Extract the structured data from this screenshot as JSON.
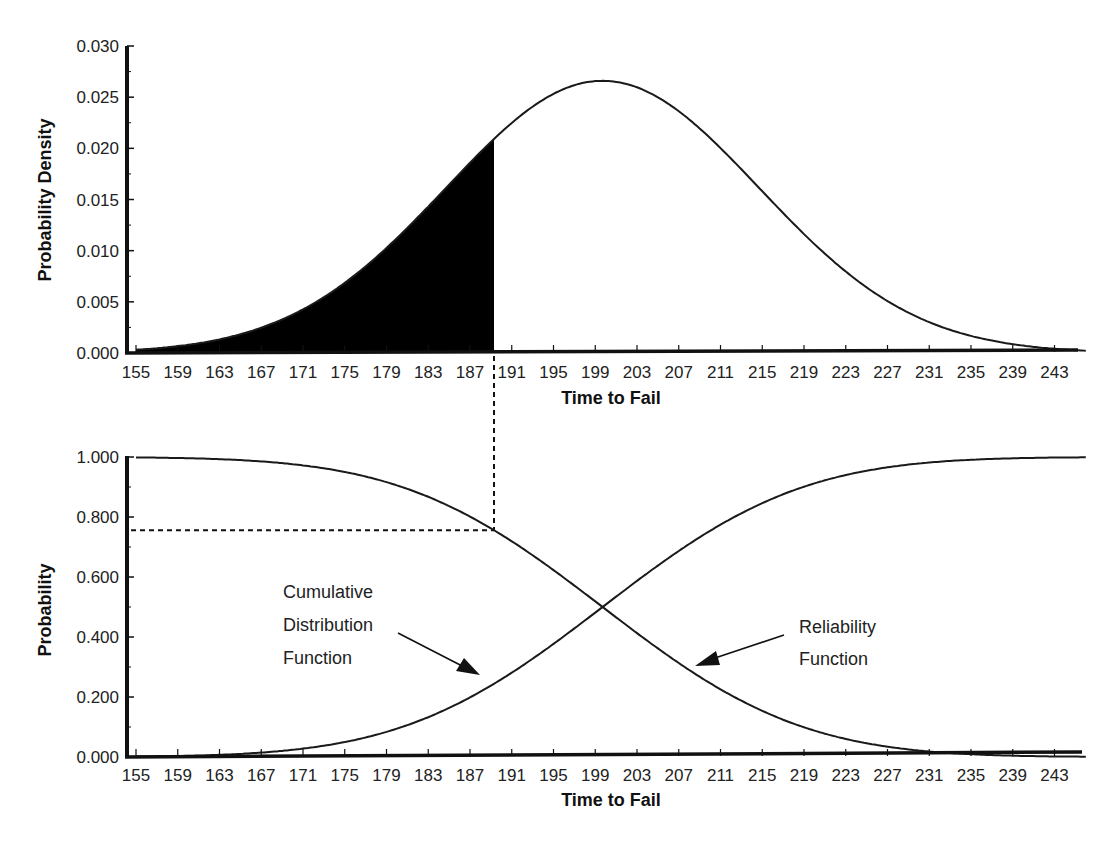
{
  "chart_data": [
    {
      "id": "pdf",
      "type": "area",
      "title": "",
      "xlabel": "Time to Fail",
      "ylabel": "Probability Density",
      "x_tick_labels": [
        "155",
        "159",
        "163",
        "167",
        "171",
        "175",
        "179",
        "183",
        "187",
        "191",
        "195",
        "199",
        "203",
        "207",
        "211",
        "215",
        "219",
        "223",
        "227",
        "231",
        "235",
        "239",
        "243"
      ],
      "y_tick_labels": [
        "0.000",
        "0.005",
        "0.010",
        "0.015",
        "0.020",
        "0.025",
        "0.030"
      ],
      "xlim": [
        154,
        246
      ],
      "ylim": [
        0,
        0.03
      ],
      "grid": false,
      "legend": null,
      "distribution": {
        "name": "normal",
        "mean": 199.7,
        "std": 15
      },
      "series": [
        {
          "name": "Probability density function",
          "style": "line",
          "x": [
            155,
            159,
            163,
            167,
            171,
            175,
            179,
            183,
            187,
            189.3,
            191,
            195,
            199,
            203,
            207,
            211,
            215,
            219,
            223,
            227,
            231,
            235,
            239,
            243,
            246
          ],
          "values": [
            0.0016,
            0.0027,
            0.0044,
            0.0066,
            0.0095,
            0.0131,
            0.0172,
            0.0214,
            0.0248,
            0.0208,
            0.0229,
            0.0253,
            0.0266,
            0.0261,
            0.0237,
            0.0201,
            0.0158,
            0.0115,
            0.0078,
            0.0049,
            0.0029,
            0.0016,
            0.0008,
            0.0004,
            0.0002
          ]
        },
        {
          "name": "Shaded area (failure probability up to t)",
          "style": "filled",
          "x_from": 155,
          "x_to": 189.3
        }
      ],
      "annotations": [
        {
          "type": "dashed-vertical-line",
          "x": 189.3,
          "extends_to": "lower chart"
        }
      ]
    },
    {
      "id": "cdf-reliability",
      "type": "line",
      "title": "",
      "xlabel": "Time to Fail",
      "ylabel": "Probability",
      "x_tick_labels": [
        "155",
        "159",
        "163",
        "167",
        "171",
        "175",
        "179",
        "183",
        "187",
        "191",
        "195",
        "199",
        "203",
        "207",
        "211",
        "215",
        "219",
        "223",
        "227",
        "231",
        "235",
        "239",
        "243"
      ],
      "y_tick_labels": [
        "0.000",
        "0.200",
        "0.400",
        "0.600",
        "0.800",
        "1.000"
      ],
      "xlim": [
        154,
        246
      ],
      "ylim": [
        0,
        1.0
      ],
      "grid": false,
      "legend": null,
      "distribution": {
        "name": "normal",
        "mean": 199.7,
        "std": 15
      },
      "series": [
        {
          "name": "Cumulative Distribution Function",
          "x": [
            155,
            159,
            163,
            167,
            171,
            175,
            179,
            183,
            187,
            191,
            195,
            199,
            203,
            207,
            211,
            215,
            219,
            223,
            227,
            231,
            235,
            239,
            243
          ],
          "values": [
            0.001,
            0.003,
            0.007,
            0.015,
            0.028,
            0.05,
            0.084,
            0.133,
            0.198,
            0.281,
            0.378,
            0.481,
            0.587,
            0.686,
            0.773,
            0.846,
            0.901,
            0.94,
            0.966,
            0.982,
            0.991,
            0.996,
            0.998
          ]
        },
        {
          "name": "Reliability Function",
          "x": [
            155,
            159,
            163,
            167,
            171,
            175,
            179,
            183,
            187,
            191,
            195,
            199,
            203,
            207,
            211,
            215,
            219,
            223,
            227,
            231,
            235,
            239,
            243
          ],
          "values": [
            0.999,
            0.997,
            0.993,
            0.985,
            0.972,
            0.95,
            0.916,
            0.867,
            0.802,
            0.719,
            0.622,
            0.519,
            0.413,
            0.314,
            0.227,
            0.154,
            0.099,
            0.06,
            0.034,
            0.018,
            0.009,
            0.004,
            0.002
          ]
        }
      ],
      "annotations": [
        {
          "type": "dashed-horizontal-line",
          "y": 0.763,
          "from_x": 155,
          "to_x": 189.3
        },
        {
          "type": "dashed-vertical-line",
          "x": 189.3,
          "y": 0.763
        },
        {
          "type": "label-arrow",
          "text": [
            "Cumulative",
            "Distribution",
            "Function"
          ]
        },
        {
          "type": "label-arrow",
          "text": [
            "Reliability",
            "Function"
          ]
        }
      ]
    }
  ],
  "top_chart": {
    "ylabel": "Probability Density",
    "xlabel": "Time to Fail",
    "y_ticks": [
      "0.000",
      "0.005",
      "0.010",
      "0.015",
      "0.020",
      "0.025",
      "0.030"
    ]
  },
  "bottom_chart": {
    "ylabel": "Probability",
    "xlabel": "Time to Fail",
    "y_ticks": [
      "0.000",
      "0.200",
      "0.400",
      "0.600",
      "0.800",
      "1.000"
    ],
    "cdf_label": [
      "Cumulative",
      "Distribution",
      "Function"
    ],
    "reliability_label": [
      "Reliability",
      "Function"
    ]
  },
  "x_ticks": [
    "155",
    "159",
    "163",
    "167",
    "171",
    "175",
    "179",
    "183",
    "187",
    "191",
    "195",
    "199",
    "203",
    "207",
    "211",
    "215",
    "219",
    "223",
    "227",
    "231",
    "235",
    "239",
    "243"
  ],
  "params": {
    "mean": 199.7,
    "std": 15,
    "cut_time": 189.3
  },
  "colors": {
    "curve": "#1a1a1a",
    "fill": "#000000",
    "axis": "#111111",
    "text": "#222222"
  }
}
